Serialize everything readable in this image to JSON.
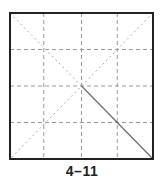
{
  "figure": {
    "caption": "4–11",
    "box": {
      "x": 10,
      "y": 13,
      "width": 143,
      "height": 146,
      "stroke": "#222222"
    },
    "grid": {
      "divisions": 4,
      "style": "dashed",
      "color": "#999999"
    },
    "diagonals": {
      "style": "dashed",
      "color": "#aaaaaa"
    },
    "highlight_fold": {
      "from": "center",
      "to": "bottom-right",
      "style": "solid",
      "color": "#666666"
    }
  }
}
